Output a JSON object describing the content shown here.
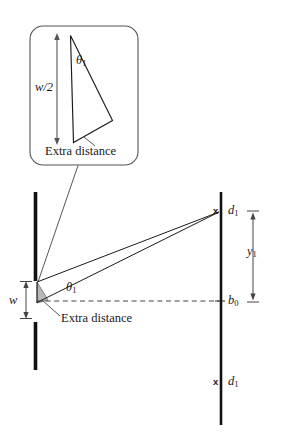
{
  "figure": {
    "type": "optics-ray-diagram",
    "background_color": "#ffffff",
    "stroke_color": "#1a1a1a",
    "shade_color": "#b8b8b8",
    "inset": {
      "name": "magnified-slit-detail",
      "shape": "rounded-rectangle",
      "labels": {
        "half_width": "w/2",
        "half_width_symbol": "w",
        "half_width_suffix": "/2",
        "angle": "θ",
        "angle_sub": "1",
        "extra_distance": "Extra distance"
      }
    },
    "main": {
      "barrier": {
        "name": "slit-barrier",
        "upper_bar_label": "",
        "lower_bar_label": ""
      },
      "slit": {
        "width_label": "w"
      },
      "angle_label": "θ",
      "angle_sub": "1",
      "extra_distance": "Extra distance",
      "screen": {
        "name": "observation-screen",
        "center_marker": "b",
        "center_marker_sub": "0",
        "upper_minimum_marker": "x",
        "upper_minimum_label": "d",
        "upper_minimum_sub": "1",
        "lower_minimum_marker": "x",
        "lower_minimum_label": "d",
        "lower_minimum_sub": "1",
        "offset_label": "y",
        "offset_sub": "1"
      }
    }
  }
}
